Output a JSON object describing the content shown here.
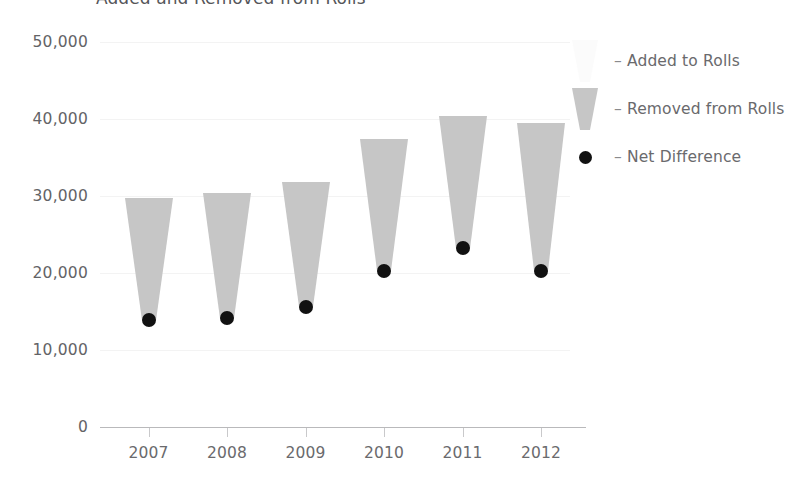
{
  "chart_data": {
    "type": "bar",
    "title": "Added and Removed from Rolls",
    "xlabel": "",
    "ylabel": "",
    "categories": [
      "2007",
      "2008",
      "2009",
      "2010",
      "2011",
      "2012"
    ],
    "ylim": [
      0,
      50000
    ],
    "yticks": [
      0,
      10000,
      20000,
      30000,
      40000,
      50000
    ],
    "ytick_labels": [
      "0",
      "10,000",
      "20,000",
      "30,000",
      "40,000",
      "50,000"
    ],
    "grid": true,
    "legend_position": "right",
    "series": [
      {
        "name": "Removed from Rolls",
        "color": "#c6c6c6",
        "values": [
          29800,
          30400,
          31800,
          37400,
          40400,
          39500
        ]
      },
      {
        "name": "Added to Rolls",
        "color": "#fbfbfb",
        "values": [
          15900,
          16200,
          16200,
          17100,
          17200,
          19200
        ]
      },
      {
        "name": "Net Difference",
        "color": "#111111",
        "values": [
          13900,
          14100,
          15600,
          20300,
          23200,
          20300
        ]
      }
    ],
    "annotations": []
  },
  "title": {
    "text": "Added and Removed from Rolls"
  },
  "y_axis": {
    "labels": [
      "50,000",
      "40,000",
      "30,000",
      "20,000",
      "10,000",
      "0"
    ]
  },
  "x_axis": {
    "labels": [
      "2007",
      "2008",
      "2009",
      "2010",
      "2011",
      "2012"
    ]
  },
  "legend": {
    "items": [
      {
        "dash": "–",
        "label": "Added to Rolls",
        "symbol": "funnel-light-icon"
      },
      {
        "dash": "–",
        "label": "Removed from Rolls",
        "symbol": "funnel-gray-icon"
      },
      {
        "dash": "–",
        "label": "Net Difference",
        "symbol": "dot-black-icon"
      }
    ]
  },
  "colors": {
    "bar_gray": "#c6c6c6",
    "bar_light": "#fbfbfb",
    "dot": "#111111",
    "text": "#6a6a6d",
    "grid": "#f3f3f3",
    "axis": "#b9b9bb"
  }
}
